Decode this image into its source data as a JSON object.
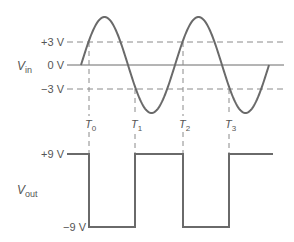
{
  "diagram": {
    "type": "comparator waveform",
    "colors": {
      "wave": "#6a6a6a",
      "dash": "#8a8a8a",
      "text": "#555555",
      "background": "#ffffff"
    },
    "input": {
      "label_main": "V",
      "label_sub": "in",
      "levels": [
        {
          "label": "+3 V",
          "value": 3,
          "style": "dashed"
        },
        {
          "label": "0 V",
          "value": 0,
          "style": "solid"
        },
        {
          "label": "−3 V",
          "value": -3,
          "style": "dashed"
        }
      ],
      "waveform": "sine"
    },
    "output": {
      "label_main": "V",
      "label_sub": "out",
      "levels": [
        {
          "label": "+9 V",
          "value": 9
        },
        {
          "label": "−9 V",
          "value": -9
        }
      ],
      "waveform": "square"
    },
    "time_markers": [
      {
        "main": "T",
        "sub": "0"
      },
      {
        "main": "T",
        "sub": "1"
      },
      {
        "main": "T",
        "sub": "2"
      },
      {
        "main": "T",
        "sub": "3"
      }
    ]
  }
}
